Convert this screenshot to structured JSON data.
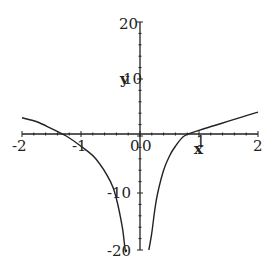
{
  "chart_data": {
    "type": "line",
    "title": "",
    "xlabel": "x",
    "ylabel": "y",
    "xlim": [
      -2,
      2
    ],
    "ylim": [
      -20,
      20
    ],
    "grid": false,
    "legend": null,
    "x_ticks": [
      "-2",
      "-1",
      "0",
      "1",
      "2"
    ],
    "y_ticks": [
      "20",
      "10",
      "-10",
      "-20"
    ],
    "origin_label": "0",
    "series": [
      {
        "name": "f(x)",
        "description": "Curve with vertical asymptote at x=0, both branches tending to -infinity near 0; zeros near x=-1.25 and x=0.75",
        "x": [
          -2.0,
          -1.75,
          -1.5,
          -1.25,
          -1.0,
          -0.75,
          -0.5,
          -0.4,
          -0.3,
          -0.25,
          -0.22
        ],
        "y": [
          3.2,
          2.5,
          1.3,
          0.0,
          -1.8,
          -4.0,
          -8.0,
          -11.0,
          -16.0,
          -20.0,
          -20.0
        ]
      },
      {
        "name": "f(x) right branch",
        "x": [
          0.15,
          0.2,
          0.25,
          0.3,
          0.4,
          0.5,
          0.6,
          0.75,
          1.0,
          1.25,
          1.5,
          1.75,
          2.0
        ],
        "y": [
          -20.0,
          -17.0,
          -13.0,
          -10.0,
          -6.0,
          -3.5,
          -1.8,
          0.0,
          1.0,
          1.8,
          2.6,
          3.4,
          4.2
        ]
      }
    ]
  }
}
